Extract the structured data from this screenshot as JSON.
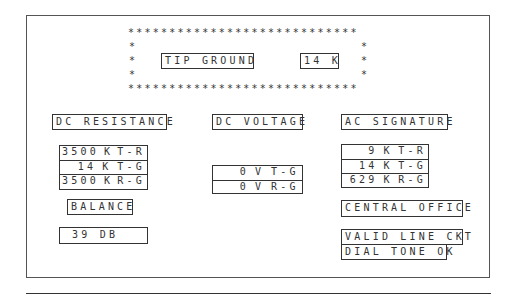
{
  "header": {
    "test_label": "TIP GROUND",
    "test_value": "14 K"
  },
  "dc_resistance": {
    "title": "DC RESISTANCE",
    "rows": [
      {
        "value": "3500",
        "unit": "K",
        "pair": "T-R"
      },
      {
        "value": "14",
        "unit": "K",
        "pair": "T-G"
      },
      {
        "value": "3500",
        "unit": "K",
        "pair": "R-G"
      }
    ]
  },
  "dc_voltage": {
    "title": "DC VOLTAGE",
    "rows": [
      {
        "value": "0",
        "unit": "V",
        "pair": "T-G"
      },
      {
        "value": "0",
        "unit": "V",
        "pair": "R-G"
      }
    ]
  },
  "ac_signature": {
    "title": "AC SIGNATURE",
    "rows": [
      {
        "value": "9",
        "unit": "K",
        "pair": "T-R"
      },
      {
        "value": "14",
        "unit": "K",
        "pair": "T-G"
      },
      {
        "value": "629",
        "unit": "K",
        "pair": "R-G"
      }
    ]
  },
  "balance": {
    "title": "BALANCE",
    "value": "39 DB"
  },
  "central_office": {
    "title": "CENTRAL OFFICE",
    "status_lines": [
      "VALID LINE CKT",
      "DIAL TONE OK"
    ]
  },
  "decor": {
    "star_row": "* * * * * * * * * * * * * * * * * * * * * * * * * * * *",
    "star": "*"
  }
}
